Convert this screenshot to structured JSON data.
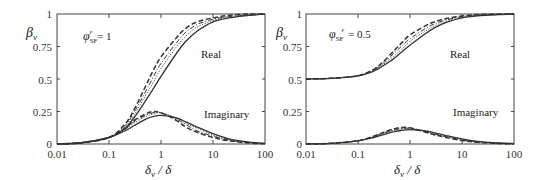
{
  "chart_data": [
    {
      "type": "line",
      "title": "",
      "annotation": "φSF^ε = 1",
      "xlabel": "δv / δ",
      "ylabel": "βv",
      "xscale": "log",
      "xlim": [
        0.01,
        100
      ],
      "ylim": [
        0,
        1
      ],
      "xticks": [
        "0.01",
        "0.1",
        "1",
        "10",
        "100"
      ],
      "yticks": [
        "0",
        "0.25",
        "0.5",
        "0.75",
        "1"
      ],
      "grid": false,
      "labels": [
        "Real",
        "Imaginary"
      ],
      "x": [
        0.01,
        0.03,
        0.1,
        0.2,
        0.3,
        0.5,
        0.7,
        1,
        2,
        3,
        5,
        10,
        20,
        50,
        100
      ],
      "series": [
        {
          "name": "Real (solid)",
          "style": "solid",
          "values": [
            0.0,
            0.01,
            0.05,
            0.12,
            0.2,
            0.33,
            0.42,
            0.52,
            0.7,
            0.79,
            0.87,
            0.94,
            0.97,
            0.99,
            1.0
          ]
        },
        {
          "name": "Real (dotted)",
          "style": "dotted",
          "values": [
            0.0,
            0.01,
            0.05,
            0.13,
            0.22,
            0.37,
            0.47,
            0.58,
            0.75,
            0.83,
            0.9,
            0.95,
            0.98,
            0.99,
            1.0
          ]
        },
        {
          "name": "Real (dash-dot)",
          "style": "dashdot",
          "values": [
            0.0,
            0.01,
            0.05,
            0.14,
            0.24,
            0.4,
            0.51,
            0.62,
            0.78,
            0.86,
            0.92,
            0.96,
            0.98,
            0.99,
            1.0
          ]
        },
        {
          "name": "Real (dashed)",
          "style": "dashed",
          "values": [
            0.0,
            0.01,
            0.05,
            0.15,
            0.26,
            0.44,
            0.56,
            0.67,
            0.82,
            0.89,
            0.94,
            0.97,
            0.99,
            1.0,
            1.0
          ]
        },
        {
          "name": "Imaginary (solid)",
          "style": "solid",
          "values": [
            0.0,
            0.01,
            0.05,
            0.1,
            0.14,
            0.19,
            0.21,
            0.22,
            0.2,
            0.17,
            0.13,
            0.08,
            0.04,
            0.015,
            0.005
          ]
        },
        {
          "name": "Imaginary (dotted)",
          "style": "dotted",
          "values": [
            0.0,
            0.01,
            0.05,
            0.11,
            0.16,
            0.21,
            0.23,
            0.24,
            0.2,
            0.16,
            0.12,
            0.07,
            0.035,
            0.012,
            0.004
          ]
        },
        {
          "name": "Imaginary (dash-dot)",
          "style": "dashdot",
          "values": [
            0.0,
            0.01,
            0.05,
            0.11,
            0.17,
            0.22,
            0.24,
            0.24,
            0.19,
            0.15,
            0.1,
            0.06,
            0.03,
            0.01,
            0.003
          ]
        },
        {
          "name": "Imaginary (dashed)",
          "style": "dashed",
          "values": [
            0.0,
            0.01,
            0.05,
            0.12,
            0.18,
            0.23,
            0.25,
            0.24,
            0.18,
            0.13,
            0.09,
            0.05,
            0.025,
            0.008,
            0.002
          ]
        }
      ]
    },
    {
      "type": "line",
      "title": "",
      "annotation": "φSF^ε = 0.5",
      "xlabel": "δv / δ",
      "ylabel": "βv",
      "xscale": "log",
      "xlim": [
        0.01,
        100
      ],
      "ylim": [
        0,
        1
      ],
      "xticks": [
        "0.01",
        "0.1",
        "1",
        "10",
        "100"
      ],
      "yticks": [
        "0",
        "0.25",
        "0.5",
        "0.75",
        "1"
      ],
      "grid": false,
      "labels": [
        "Real",
        "Imaginary"
      ],
      "x": [
        0.01,
        0.03,
        0.1,
        0.2,
        0.3,
        0.5,
        0.7,
        1,
        2,
        3,
        5,
        10,
        20,
        50,
        100
      ],
      "series": [
        {
          "name": "Real (solid)",
          "style": "solid",
          "values": [
            0.5,
            0.505,
            0.525,
            0.56,
            0.6,
            0.66,
            0.71,
            0.76,
            0.85,
            0.895,
            0.935,
            0.97,
            0.985,
            0.995,
            1.0
          ]
        },
        {
          "name": "Real (dotted)",
          "style": "dotted",
          "values": [
            0.5,
            0.505,
            0.525,
            0.565,
            0.61,
            0.68,
            0.73,
            0.79,
            0.87,
            0.91,
            0.945,
            0.975,
            0.99,
            0.997,
            1.0
          ]
        },
        {
          "name": "Real (dash-dot)",
          "style": "dashdot",
          "values": [
            0.5,
            0.505,
            0.525,
            0.57,
            0.62,
            0.7,
            0.755,
            0.81,
            0.89,
            0.925,
            0.955,
            0.98,
            0.99,
            0.998,
            1.0
          ]
        },
        {
          "name": "Real (dashed)",
          "style": "dashed",
          "values": [
            0.5,
            0.505,
            0.525,
            0.575,
            0.63,
            0.72,
            0.78,
            0.84,
            0.91,
            0.94,
            0.965,
            0.985,
            0.995,
            1.0,
            1.0
          ]
        },
        {
          "name": "Imaginary (solid)",
          "style": "solid",
          "values": [
            0.0,
            0.005,
            0.025,
            0.05,
            0.07,
            0.095,
            0.105,
            0.11,
            0.1,
            0.085,
            0.065,
            0.04,
            0.02,
            0.008,
            0.003
          ]
        },
        {
          "name": "Imaginary (dotted)",
          "style": "dotted",
          "values": [
            0.0,
            0.005,
            0.025,
            0.055,
            0.08,
            0.105,
            0.115,
            0.12,
            0.1,
            0.08,
            0.06,
            0.035,
            0.018,
            0.006,
            0.002
          ]
        },
        {
          "name": "Imaginary (dash-dot)",
          "style": "dashdot",
          "values": [
            0.0,
            0.005,
            0.025,
            0.057,
            0.083,
            0.11,
            0.12,
            0.12,
            0.095,
            0.075,
            0.055,
            0.03,
            0.015,
            0.005,
            0.002
          ]
        },
        {
          "name": "Imaginary (dashed)",
          "style": "dashed",
          "values": [
            0.0,
            0.005,
            0.025,
            0.06,
            0.088,
            0.117,
            0.127,
            0.125,
            0.09,
            0.07,
            0.05,
            0.027,
            0.013,
            0.004,
            0.001
          ]
        }
      ]
    }
  ],
  "panels": [
    {
      "ylabel": "β",
      "ylabel_sub": "v",
      "xlabel_main": "δ",
      "xlabel_sub": "v",
      "xlabel_tail": " / δ",
      "param_symbol": "φ",
      "param_sub": "SF",
      "param_sup": "ε",
      "param_value": " = 1",
      "label_real": "Real",
      "label_imag": "Imaginary",
      "yticks": [
        "0",
        "0.25",
        "0.5",
        "0.75",
        "1"
      ],
      "xticks": [
        "0.01",
        "0.1",
        "1",
        "10",
        "100"
      ]
    },
    {
      "ylabel": "β",
      "ylabel_sub": "v",
      "xlabel_main": "δ",
      "xlabel_sub": "v",
      "xlabel_tail": " / δ",
      "param_symbol": "φ",
      "param_sub": "SF",
      "param_sup": "ε",
      "param_value": " = 0.5",
      "label_real": "Real",
      "label_imag": "Imaginary",
      "yticks": [
        "0",
        "0.25",
        "0.5",
        "0.75",
        "1"
      ],
      "xticks": [
        "0.01",
        "0.1",
        "1",
        "10",
        "100"
      ]
    }
  ]
}
